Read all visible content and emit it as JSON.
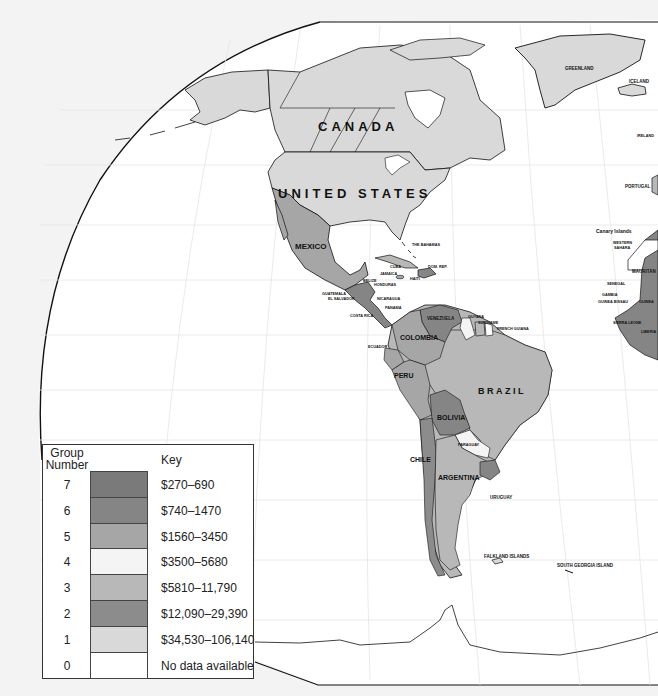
{
  "map": {
    "title": "",
    "labels": {
      "canada": "CANADA",
      "united_states": "UNITED STATES",
      "mexico": "MEXICO",
      "greenland": "GREENLAND",
      "iceland": "ICELAND",
      "ireland": "IRELAND",
      "portugal": "PORTUGAL",
      "canary_islands": "Canary Islands",
      "western_sahara_1": "WESTERN",
      "western_sahara_2": "SAHARA",
      "mauritania": "MAURITAN",
      "senegal": "SENEGAL",
      "gambia": "GAMBIA",
      "guinea_bissau": "GUINEA BISSAU",
      "guinea": "GUINEA",
      "sierra_leone": "SIERRA LEONE",
      "liberia": "LIBERIA",
      "the_bahamas": "THE BAHAMAS",
      "cuba": "CUBA",
      "jamaica": "JAMAICA",
      "haiti": "HAITI",
      "dom_rep": "DOM. REP.",
      "belize": "BELIZE",
      "honduras": "HONDURAS",
      "guatemala": "GUATEMALA",
      "el_salvador": "EL SALVADOR",
      "nicaragua": "NICARAGUA",
      "panama": "PANAMA",
      "costa_rica": "COSTA RICA",
      "venezuela": "VENEZUELA",
      "guyana": "GUYANA",
      "suriname": "SURINAME",
      "french_guiana": "FRENCH GUIANA",
      "colombia": "COLOMBIA",
      "ecuador": "ECUADOR",
      "peru": "PERU",
      "brazil": "BRAZIL",
      "bolivia": "BOLIVIA",
      "paraguay": "PARAGUAY",
      "chile": "CHILE",
      "argentina": "ARGENTINA",
      "uruguay": "URUGUAY",
      "falkland_islands": "FALKLAND ISLANDS",
      "south_georgia_island": "SOUTH GEORGIA ISLAND"
    }
  },
  "colors": {
    "ocean": "#ffffff",
    "background": "#f3f3f3",
    "outline": "#111111",
    "group7": "#7a7a7a",
    "group6": "#858585",
    "group5": "#a6a6a6",
    "group4": "#f4f4f4",
    "group3": "#b8b8b8",
    "group2": "#8c8c8c",
    "group1": "#d9d9d9",
    "group0": "#ffffff"
  },
  "key": {
    "group_header": "Group Number",
    "key_header": "Key",
    "rows": [
      {
        "group": "7",
        "range": "$270–690",
        "color": "#7a7a7a"
      },
      {
        "group": "6",
        "range": "$740–1470",
        "color": "#858585"
      },
      {
        "group": "5",
        "range": "$1560–3450",
        "color": "#a6a6a6"
      },
      {
        "group": "4",
        "range": "$3500–5680",
        "color": "#f4f4f4"
      },
      {
        "group": "3",
        "range": "$5810–11,790",
        "color": "#b8b8b8"
      },
      {
        "group": "2",
        "range": "$12,090–29,390",
        "color": "#8c8c8c"
      },
      {
        "group": "1",
        "range": "$34,530–106,140",
        "color": "#d9d9d9"
      },
      {
        "group": "0",
        "range": "No data available",
        "color": "#ffffff"
      }
    ]
  }
}
